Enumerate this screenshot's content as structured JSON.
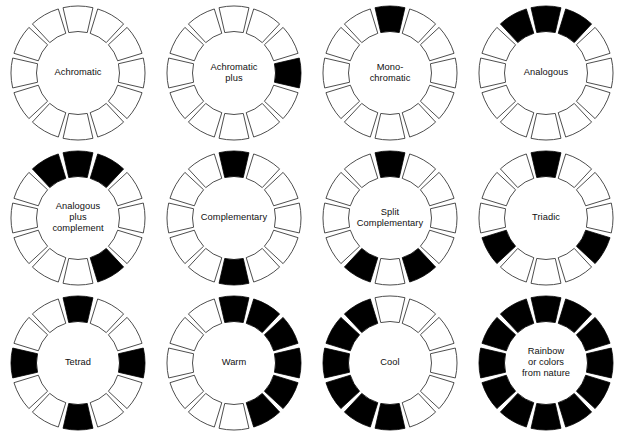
{
  "page": {
    "background_color": "#ffffff",
    "segment_fill_on": "#000000",
    "segment_fill_off": "#ffffff",
    "segment_stroke": "#3a3a3a",
    "hub_fill": "#ffffff",
    "label_color": "#101010",
    "columns": 4,
    "rows": 3,
    "segments_per_wheel": 12
  },
  "wheels": [
    {
      "id": "achromatic",
      "label": "Achromatic",
      "label_lines": [
        "Achromatic"
      ],
      "filled_segments": [],
      "filled_count": 0
    },
    {
      "id": "achromatic-plus",
      "label": "Achromatic plus",
      "label_lines": [
        "Achromatic",
        "plus"
      ],
      "filled_segments": [
        3
      ],
      "filled_count": 1
    },
    {
      "id": "monochromatic",
      "label": "Mono-chromatic",
      "label_lines": [
        "Mono-",
        "chromatic"
      ],
      "filled_segments": [
        0
      ],
      "filled_count": 1
    },
    {
      "id": "analogous",
      "label": "Analogous",
      "label_lines": [
        "Analogous"
      ],
      "filled_segments": [
        11,
        0,
        1
      ],
      "filled_count": 3
    },
    {
      "id": "analogous-plus-complement",
      "label": "Analogous plus complement",
      "label_lines": [
        "Analogous",
        "plus",
        "complement"
      ],
      "filled_segments": [
        11,
        0,
        1,
        5
      ],
      "filled_count": 4
    },
    {
      "id": "complementary",
      "label": "Complementary",
      "label_lines": [
        "Complementary"
      ],
      "filled_segments": [
        0,
        6
      ],
      "filled_count": 2
    },
    {
      "id": "split-complementary",
      "label": "Split Complementary",
      "label_lines": [
        "Split",
        "Complementary"
      ],
      "filled_segments": [
        0,
        5,
        7
      ],
      "filled_count": 3
    },
    {
      "id": "triadic",
      "label": "Triadic",
      "label_lines": [
        "Triadic"
      ],
      "filled_segments": [
        0,
        4,
        8
      ],
      "filled_count": 3
    },
    {
      "id": "tetrad",
      "label": "Tetrad",
      "label_lines": [
        "Tetrad"
      ],
      "filled_segments": [
        0,
        3,
        6,
        9
      ],
      "filled_count": 4
    },
    {
      "id": "warm",
      "label": "Warm",
      "label_lines": [
        "Warm"
      ],
      "filled_segments": [
        0,
        1,
        2,
        3,
        4,
        5
      ],
      "filled_count": 6
    },
    {
      "id": "cool",
      "label": "Cool",
      "label_lines": [
        "Cool"
      ],
      "filled_segments": [
        6,
        7,
        8,
        9,
        10,
        11
      ],
      "filled_count": 6
    },
    {
      "id": "rainbow",
      "label": "Rainbow or colors from nature",
      "label_lines": [
        "Rainbow",
        "or colors",
        "from nature"
      ],
      "filled_segments": [
        0,
        1,
        2,
        3,
        4,
        5,
        6,
        7,
        8,
        9,
        10,
        11
      ],
      "filled_count": 12
    }
  ]
}
